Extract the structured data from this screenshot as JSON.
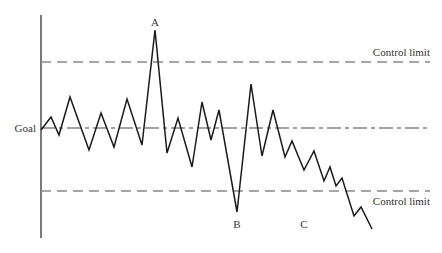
{
  "chart_data": {
    "type": "line",
    "title": "",
    "xlabel": "",
    "ylabel": "",
    "grid": false,
    "legend": "none",
    "reference_lines": [
      {
        "name": "upper_control_limit",
        "label": "Control limit",
        "style": "dashed",
        "y_px": 62
      },
      {
        "name": "goal",
        "label": "Goal",
        "style": "dash-dot",
        "y_px": 128
      },
      {
        "name": "lower_control_limit",
        "label": "Control limit",
        "style": "dashed",
        "y_px": 191
      }
    ],
    "annotations": [
      {
        "label": "A",
        "x_px": 155,
        "y_px": 22,
        "note": "peak above upper control limit"
      },
      {
        "label": "B",
        "x_px": 237,
        "y_px": 227,
        "note": "trough below lower control limit"
      },
      {
        "label": "C",
        "x_px": 303,
        "y_px": 227,
        "note": "downward trend crossing lower control limit"
      }
    ],
    "series": [
      {
        "name": "process",
        "points_px": [
          [
            41,
            130
          ],
          [
            51,
            117
          ],
          [
            59,
            135
          ],
          [
            70,
            97
          ],
          [
            89,
            150
          ],
          [
            101,
            113
          ],
          [
            114,
            147
          ],
          [
            127,
            99
          ],
          [
            142,
            145
          ],
          [
            155,
            30
          ],
          [
            167,
            153
          ],
          [
            178,
            118
          ],
          [
            192,
            167
          ],
          [
            202,
            102
          ],
          [
            211,
            140
          ],
          [
            219,
            110
          ],
          [
            237,
            212
          ],
          [
            251,
            84
          ],
          [
            262,
            156
          ],
          [
            273,
            110
          ],
          [
            285,
            157
          ],
          [
            292,
            141
          ],
          [
            304,
            170
          ],
          [
            314,
            151
          ],
          [
            324,
            181
          ],
          [
            330,
            167
          ],
          [
            336,
            186
          ],
          [
            342,
            178
          ],
          [
            354,
            216
          ],
          [
            361,
            207
          ],
          [
            372,
            229
          ]
        ]
      }
    ],
    "axis": {
      "x_px": 41,
      "y_top_px": 15,
      "y_bottom_px": 238
    }
  },
  "labels": {
    "goal": "Goal",
    "ucl": "Control limit",
    "lcl": "Control limit",
    "a": "A",
    "b": "B",
    "c": "C"
  },
  "colors": {
    "line": "#1a1a1a",
    "axis": "#333333",
    "limit": "#8a8a8a",
    "goal": "#444444"
  }
}
